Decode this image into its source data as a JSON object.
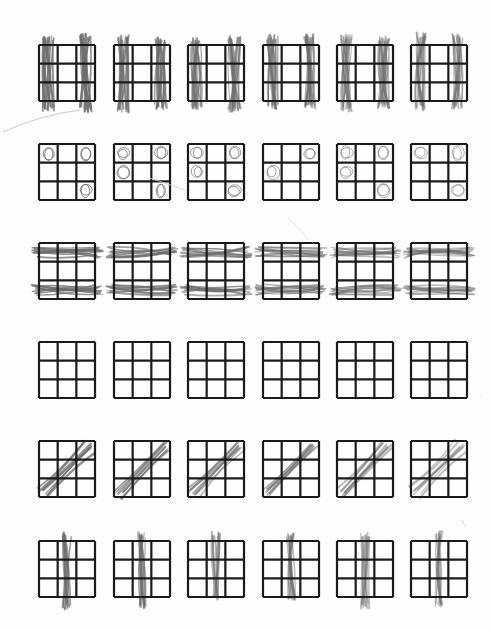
{
  "worksheet": {
    "layout": {
      "rows": 6,
      "cols": 6,
      "grid_size": 3
    },
    "colors": {
      "paper": "#fefefe",
      "grid_line": "#1a1a1a",
      "pencil": "#6e6e6e"
    },
    "rows": [
      {
        "pattern": "left-and-right-columns-shaded",
        "marks": "vertical-scribbles",
        "shaded_columns": [
          0,
          2
        ]
      },
      {
        "pattern": "corner-cells-circles",
        "marks": "small-circles",
        "cells": [
          [
            0,
            0
          ],
          [
            1,
            0
          ],
          [
            0,
            2
          ],
          [
            2,
            2
          ]
        ]
      },
      {
        "pattern": "top-and-bottom-rows-shaded",
        "marks": "horizontal-scribbles",
        "shaded_rows": [
          0,
          2
        ]
      },
      {
        "pattern": "empty",
        "marks": "none"
      },
      {
        "pattern": "diagonal-bottom-left-to-top-right",
        "marks": "diagonal-scribbles"
      },
      {
        "pattern": "middle-column-shaded",
        "marks": "vertical-scribbles",
        "shaded_columns": [
          1
        ]
      }
    ]
  }
}
